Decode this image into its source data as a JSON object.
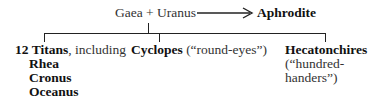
{
  "parents": {
    "label": "Gaea + Uranus"
  },
  "offspring_direct": {
    "label": "Aphrodite"
  },
  "children": [
    {
      "name_bold": "12 Titans",
      "name_suffix": ", including",
      "members": [
        "Rhea",
        "Cronus",
        "Oceanus"
      ]
    },
    {
      "name_bold": "Cyclopes",
      "name_suffix": " (“round-eyes”)"
    },
    {
      "name_bold": "Hecatonchires",
      "gloss_line1": "(“hundred-",
      "gloss_line2": "handers”)"
    }
  ]
}
